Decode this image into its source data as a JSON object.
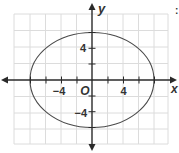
{
  "figure": {
    "type": "ellipse-on-coordinate-grid",
    "equation_implied": "x^2/64 + y^2/36 = 1",
    "axes": {
      "x_label": "x",
      "y_label": "y",
      "origin_label": "O",
      "tick_step": 2,
      "x_tick_labels": [
        {
          "value": -4,
          "text": "−4"
        },
        {
          "value": 4,
          "text": "4"
        }
      ],
      "y_tick_labels": [
        {
          "value": 4,
          "text": "4"
        },
        {
          "value": -4,
          "text": "−4"
        }
      ],
      "x_range": [
        -10,
        10
      ],
      "y_range": [
        -8,
        8
      ]
    },
    "ellipse": {
      "center": [
        0,
        0
      ],
      "semi_major_x": 8,
      "semi_minor_y": 6
    },
    "colors": {
      "grid": "#dcdcdc",
      "axis": "#2a2a2a",
      "curve": "#4a4a4a",
      "label": "#333333"
    },
    "edge_fragment": ":"
  }
}
